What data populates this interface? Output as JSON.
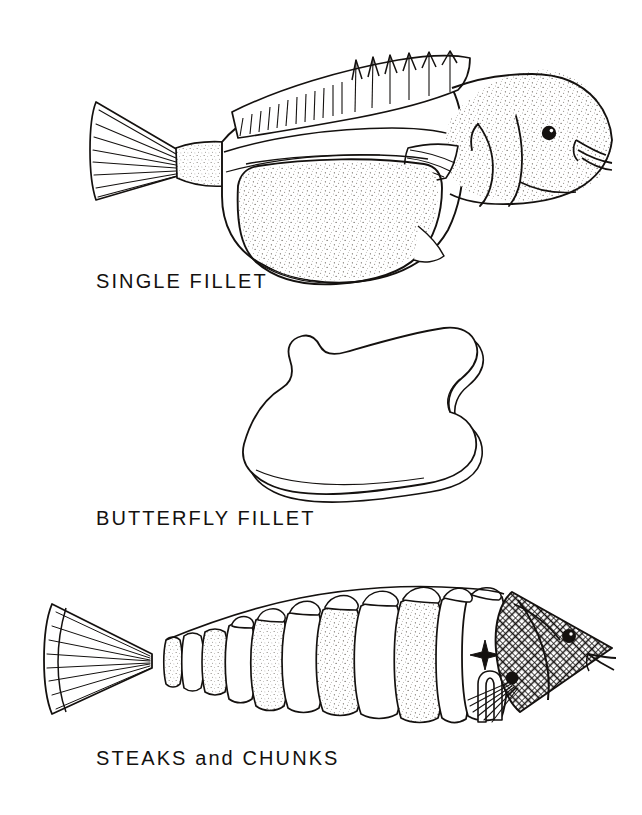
{
  "document": {
    "title": "Fish Cuts Illustration",
    "background_color": "#ffffff",
    "ink_color": "#14110f",
    "width": 642,
    "height": 815
  },
  "figures": [
    {
      "id": "single-fillet",
      "label": "SINGLE  FILLET",
      "label_x": 96,
      "label_y": 288,
      "description": "Whole fish in side view with one fillet cut away from the flank",
      "parts": [
        "tail-fin",
        "dorsal-fin",
        "body",
        "head",
        "eye",
        "pectoral-fin",
        "fillet-piece"
      ]
    },
    {
      "id": "butterfly-fillet",
      "label": "BUTTERFLY  FILLET",
      "label_x": 96,
      "label_y": 525,
      "description": "Flattened double-lobed butterfly fillet shown from above",
      "parts": [
        "fillet-outline",
        "fillet-edge-thickness"
      ]
    },
    {
      "id": "steaks-and-chunks",
      "label": "STEAKS and CHUNKS",
      "label_x": 96,
      "label_y": 765,
      "description": "Fish cut crosswise into a series of steaks with tail and head separated",
      "parts": [
        "tail-fin",
        "steak-slices",
        "chunk",
        "head",
        "eye",
        "pectoral-fin"
      ]
    }
  ],
  "colors": {
    "ink": "#14110f",
    "paper": "#ffffff",
    "stipple": "#6f6a64"
  }
}
